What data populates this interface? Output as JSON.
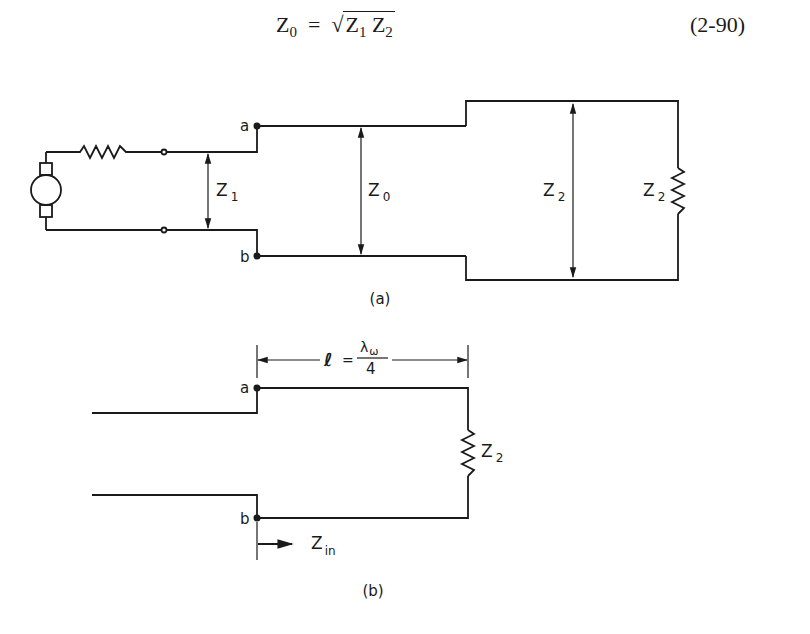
{
  "equation": {
    "lhs": "Z",
    "lhs_sub": "0",
    "equals": "=",
    "sqrt_symbol": "√",
    "rhs_a": "Z",
    "rhs_a_sub": "1",
    "rhs_b": "Z",
    "rhs_b_sub": "2",
    "number": "(2-90)"
  },
  "figure_a": {
    "caption": "(a)",
    "terminal_a": "a",
    "terminal_b": "b",
    "z1_label": "Z",
    "z1_sub": "1",
    "z0_label": "Z",
    "z0_sub": "0",
    "z2_line_label": "Z",
    "z2_line_sub": "2",
    "z2_load_label": "Z",
    "z2_load_sub": "2"
  },
  "figure_b": {
    "caption": "(b)",
    "terminal_a": "a",
    "terminal_b": "b",
    "length_symbol": "ℓ",
    "length_equals": "=",
    "length_numerator": "λ",
    "length_numerator_sub": "ω",
    "length_denominator": "4",
    "load_label": "Z",
    "load_sub": "2",
    "zin_label": "Z",
    "zin_sub": "in"
  },
  "colors": {
    "ink": "#1a1a1a",
    "background": "#ffffff"
  }
}
